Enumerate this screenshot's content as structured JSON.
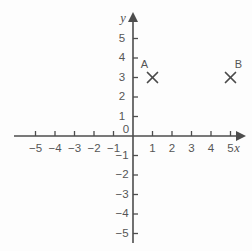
{
  "chart_data": {
    "type": "scatter",
    "title": "",
    "xlabel": "x",
    "ylabel": "y",
    "grid": false,
    "legend": false,
    "xlim": [
      -6,
      6
    ],
    "ylim": [
      -6,
      6
    ],
    "x_ticks": [
      -5,
      -4,
      -3,
      -2,
      -1,
      1,
      2,
      3,
      4,
      5
    ],
    "y_ticks": [
      5,
      4,
      3,
      2,
      1,
      -1,
      -2,
      -3,
      -4,
      -5
    ],
    "x_tick_labels": [
      "−5",
      "−4",
      "−3",
      "−2",
      "−1",
      "1",
      "2",
      "3",
      "4",
      "5"
    ],
    "y_tick_labels": [
      "5",
      "4",
      "3",
      "2",
      "1",
      "−1",
      "−2",
      "−3",
      "−4",
      "−5"
    ],
    "origin_label": "0",
    "points": [
      {
        "name": "A",
        "label": "A",
        "x": 1,
        "y": 3,
        "marker": "x",
        "label_side": "left"
      },
      {
        "name": "B",
        "label": "B",
        "x": 5,
        "y": 3,
        "marker": "x",
        "label_side": "right"
      }
    ]
  },
  "axes": {
    "x_axis_name": "x",
    "y_axis_name": "y"
  },
  "colors": {
    "background": "#fdfdfd",
    "axis": "#4d4d4d",
    "text": "#555555",
    "marker": "#4a4a4a"
  }
}
